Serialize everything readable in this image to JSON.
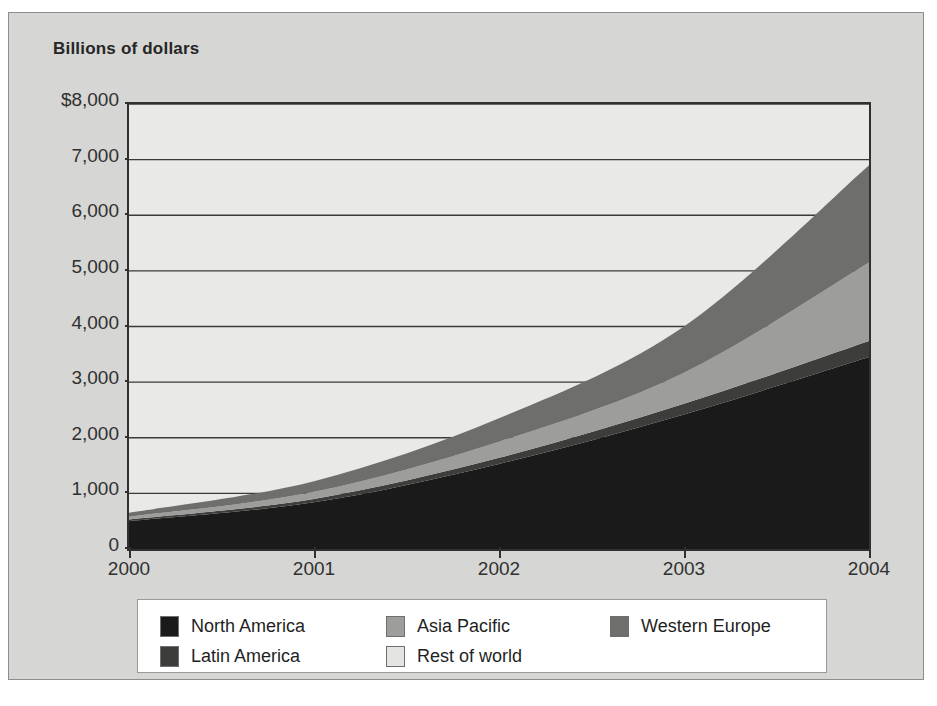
{
  "chart_title": "Billions of dollars",
  "axes": {
    "y_ticks": [
      {
        "label": "$8,000",
        "value": 8000
      },
      {
        "label": "7,000",
        "value": 7000
      },
      {
        "label": "6,000",
        "value": 6000
      },
      {
        "label": "5,000",
        "value": 5000
      },
      {
        "label": "4,000",
        "value": 4000
      },
      {
        "label": "3,000",
        "value": 3000
      },
      {
        "label": "2,000",
        "value": 2000
      },
      {
        "label": "1,000",
        "value": 1000
      },
      {
        "label": "0",
        "value": 0
      }
    ],
    "x_ticks": [
      {
        "label": "2000",
        "value": 2000
      },
      {
        "label": "2001",
        "value": 2001
      },
      {
        "label": "2002",
        "value": 2002
      },
      {
        "label": "2003",
        "value": 2003
      },
      {
        "label": "2004",
        "value": 2004
      }
    ]
  },
  "legend": {
    "entries": [
      {
        "label": "North America",
        "color": "#1a1a1a",
        "row": 0,
        "col": 0
      },
      {
        "label": "Asia Pacific",
        "color": "#9d9d9b",
        "row": 0,
        "col": 1
      },
      {
        "label": "Western Europe",
        "color": "#6e6e6c",
        "row": 0,
        "col": 2
      },
      {
        "label": "Latin America",
        "color": "#3d3d3b",
        "row": 1,
        "col": 0
      },
      {
        "label": "Rest of world",
        "color": "#e4e4e2",
        "row": 1,
        "col": 1
      }
    ]
  },
  "chart_data": {
    "type": "area",
    "stacked": true,
    "title": "Billions of dollars",
    "xlabel": "",
    "ylabel": "Billions of dollars",
    "x": [
      2000,
      2001,
      2002,
      2003,
      2004
    ],
    "categories": [
      "2000",
      "2001",
      "2002",
      "2003",
      "2004"
    ],
    "ylim": [
      0,
      8000
    ],
    "xlim": [
      2000,
      2004
    ],
    "grid": true,
    "legend_position": "bottom",
    "series": [
      {
        "name": "North America",
        "color": "#1a1a1a",
        "values": [
          500,
          840,
          1530,
          2420,
          3450
        ]
      },
      {
        "name": "Latin America",
        "color": "#3d3d3b",
        "values": [
          30,
          60,
          110,
          190,
          290
        ]
      },
      {
        "name": "Asia Pacific",
        "color": "#9d9d9b",
        "values": [
          50,
          130,
          290,
          560,
          1410
        ]
      },
      {
        "name": "Western Europe",
        "color": "#6e6e6c",
        "values": [
          70,
          190,
          420,
          830,
          1750
        ]
      },
      {
        "name": "Rest of world",
        "color": "#e4e4e2",
        "values": [
          0,
          0,
          0,
          0,
          0
        ]
      }
    ],
    "totals": [
      650,
      1220,
      2350,
      4000,
      6900
    ]
  }
}
